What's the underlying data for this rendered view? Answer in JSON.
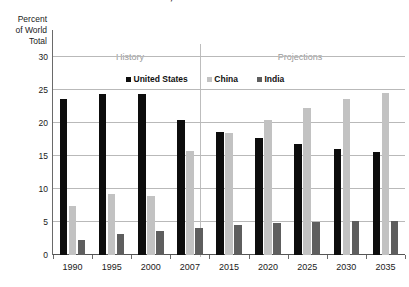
{
  "chart_data": {
    "type": "bar",
    "title": "China, and India 1990–2035",
    "xlabel": "",
    "ylabel": "Percent\nof World\nTotal",
    "ylim": [
      0,
      30
    ],
    "yticks": [
      0,
      5,
      10,
      15,
      20,
      25,
      30
    ],
    "ytick_labels": [
      "0",
      "5",
      "10",
      "15",
      "20",
      "25",
      "30"
    ],
    "grid": true,
    "legend_position": "top-center",
    "categories": [
      "1990",
      "1995",
      "2000",
      "2007",
      "2015",
      "2020",
      "2025",
      "2030",
      "2035"
    ],
    "series": [
      {
        "name": "United States",
        "color": "#0d0d0d",
        "values": [
          23.7,
          24.4,
          24.4,
          20.4,
          18.7,
          17.7,
          16.8,
          16.1,
          15.6
        ]
      },
      {
        "name": "China",
        "color": "#c2c2c2",
        "values": [
          7.5,
          9.3,
          8.9,
          15.7,
          18.5,
          20.5,
          22.2,
          23.7,
          24.6
        ]
      },
      {
        "name": "India",
        "color": "#5e5e5e",
        "values": [
          2.3,
          3.2,
          3.6,
          4.1,
          4.5,
          4.8,
          5.0,
          5.1,
          5.2
        ]
      }
    ],
    "annotations": [
      {
        "name": "history",
        "label": "History",
        "color": "#9a9a9a"
      },
      {
        "name": "projections",
        "label": "Projections",
        "color": "#9a9a9a"
      }
    ],
    "divider_after_category": "2007"
  }
}
